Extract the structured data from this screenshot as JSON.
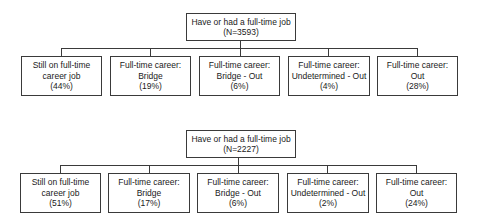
{
  "diagrams": [
    {
      "root": {
        "line1": "Have or had a full-time job",
        "line2": "(N=3593)"
      },
      "children": [
        {
          "line1": "Still on full-time",
          "line2": "career job",
          "line3": "(44%)"
        },
        {
          "line1": "Full-time career:",
          "line2": "Bridge",
          "line3": "(19%)"
        },
        {
          "line1": "Full-time career:",
          "line2": "Bridge - Out",
          "line3": "(6%)"
        },
        {
          "line1": "Full-time career:",
          "line2": "Undetermined - Out",
          "line3": "(4%)"
        },
        {
          "line1": "Full-time career:",
          "line2": "Out",
          "line3": "(28%)"
        }
      ]
    },
    {
      "root": {
        "line1": "Have or had a full-time job",
        "line2": "(N=2227)"
      },
      "children": [
        {
          "line1": "Still on full-time",
          "line2": "career job",
          "line3": "(51%)"
        },
        {
          "line1": "Full-time career:",
          "line2": "Bridge",
          "line3": "(17%)"
        },
        {
          "line1": "Full-time career:",
          "line2": "Bridge - Out",
          "line3": "(6%)"
        },
        {
          "line1": "Full-time career:",
          "line2": "Undetermined - Out",
          "line3": "(2%)"
        },
        {
          "line1": "Full-time career:",
          "line2": "Out",
          "line3": "(24%)"
        }
      ]
    }
  ]
}
